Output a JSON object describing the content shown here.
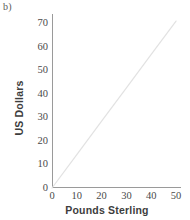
{
  "figure": {
    "panel_letter": "b)",
    "background_color": "#ffffff"
  },
  "chart_data": {
    "type": "line",
    "title": "",
    "subtitle": "",
    "xlabel": "Pounds Sterling",
    "ylabel": "US Dollars",
    "xlim": [
      0,
      52
    ],
    "ylim": [
      0,
      74
    ],
    "xticks": [
      0,
      10,
      20,
      30,
      40,
      50
    ],
    "xticklabels": [
      "0",
      "10",
      "20",
      "30",
      "40",
      "50"
    ],
    "yticks": [
      0,
      10,
      20,
      30,
      40,
      50,
      60,
      70
    ],
    "yticklabels": [
      "0",
      "10",
      "20",
      "30",
      "40",
      "50",
      "60",
      "70"
    ],
    "grid": false,
    "legend": null,
    "annotations": [],
    "series": [
      {
        "name": "Exchange rate",
        "color": "#e2e2e2",
        "linewidth": 1.2,
        "x": [
          0,
          10,
          20,
          30,
          40,
          50
        ],
        "y": [
          0,
          14.2,
          28.4,
          42.6,
          56.8,
          71.0
        ]
      }
    ]
  }
}
